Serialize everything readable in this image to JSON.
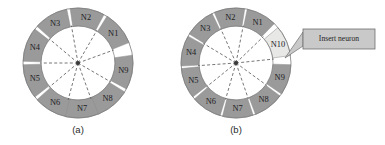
{
  "figure": {
    "background_color": "#ffffff",
    "segment_color": "#9a9a9a",
    "segment_highlight_color": "#e8e8e6",
    "segment_stroke_color": "#8d8d8d",
    "ring_outline_color": "#7b7b7b",
    "hub_color": "#3a3a3a",
    "dashed_line_color": "#4a4a4a",
    "callout_fill_color": "#c9c9c9",
    "callout_border_color": "#6e6e6e"
  },
  "panels": [
    {
      "id": "panel-a",
      "caption": "(a)",
      "center_x": 78,
      "center_y": 63,
      "outer_radius": 55,
      "inner_radius": 37,
      "segment_count": 9,
      "segments": [
        {
          "label": "N1",
          "mid_angle_deg": 40,
          "highlight": false
        },
        {
          "label": "N2",
          "mid_angle_deg": 80,
          "highlight": false
        },
        {
          "label": "N3",
          "mid_angle_deg": 120,
          "highlight": false
        },
        {
          "label": "N4",
          "mid_angle_deg": 160,
          "highlight": false
        },
        {
          "label": "N5",
          "mid_angle_deg": 200,
          "highlight": false
        },
        {
          "label": "N6",
          "mid_angle_deg": 240,
          "highlight": false
        },
        {
          "label": "N7",
          "mid_angle_deg": 275,
          "highlight": false
        },
        {
          "label": "N8",
          "mid_angle_deg": 310,
          "highlight": false
        },
        {
          "label": "N9",
          "mid_angle_deg": 350,
          "highlight": false
        }
      ]
    },
    {
      "id": "panel-b",
      "caption": "(b)",
      "center_x": 236,
      "center_y": 63,
      "outer_radius": 55,
      "inner_radius": 37,
      "segment_count": 10,
      "segments": [
        {
          "label": "N1",
          "mid_angle_deg": 62,
          "highlight": false
        },
        {
          "label": "N2",
          "mid_angle_deg": 97,
          "highlight": false
        },
        {
          "label": "N3",
          "mid_angle_deg": 132,
          "highlight": false
        },
        {
          "label": "N4",
          "mid_angle_deg": 167,
          "highlight": false
        },
        {
          "label": "N5",
          "mid_angle_deg": 202,
          "highlight": false
        },
        {
          "label": "N6",
          "mid_angle_deg": 237,
          "highlight": false
        },
        {
          "label": "N7",
          "mid_angle_deg": 272,
          "highlight": false
        },
        {
          "label": "N8",
          "mid_angle_deg": 307,
          "highlight": false
        },
        {
          "label": "N9",
          "mid_angle_deg": 342,
          "highlight": false
        },
        {
          "label": "N10",
          "mid_angle_deg": 24,
          "highlight": true
        }
      ]
    }
  ],
  "callout": {
    "text": "Insert neuron",
    "box_x": 303,
    "box_y": 29,
    "box_width": 72,
    "box_height": 20,
    "pointer_tip_x": 285,
    "pointer_tip_y": 58
  }
}
